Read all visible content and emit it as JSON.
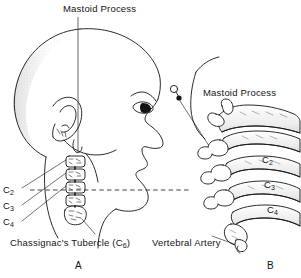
{
  "figure": {
    "background_color": "#ffffff",
    "ink_color": "#141414",
    "panels": [
      {
        "letter": "A",
        "description": "Lateral head and neck profile with cervical vertebrae and surface landmarks"
      },
      {
        "letter": "B",
        "description": "Anatomic detail of cervical vertebrae and vertebral artery"
      }
    ]
  },
  "labels": {
    "mastoid_process_top": "Mastoid Process",
    "mastoid_process_right": "Mastoid Process",
    "chassignac_prefix": "Chassignac's Tubercle (C",
    "chassignac_sub": "6",
    "chassignac_suffix": ")",
    "vertebral_artery": "Vertebral Artery",
    "c_prefix": "C",
    "levels_left": [
      {
        "label": "C2",
        "base": "C",
        "sub": "2"
      },
      {
        "label": "C3",
        "base": "C",
        "sub": "3"
      },
      {
        "label": "C4",
        "base": "C",
        "sub": "4"
      }
    ],
    "levels_right": [
      {
        "label": "C2",
        "base": "C",
        "sub": "2"
      },
      {
        "label": "C3",
        "base": "C",
        "sub": "3"
      },
      {
        "label": "C4",
        "base": "C",
        "sub": "4"
      }
    ],
    "panel_a": "A",
    "panel_b": "B"
  },
  "annotations": {
    "leader_line_vertical": "vertical leader from Mastoid Process label down to mastoid tip behind ear",
    "dashed_reference_line": "horizontal dashed line at chin / C4 level",
    "marker_b": "small open circle with filled dot marking mastoid process in panel B"
  }
}
